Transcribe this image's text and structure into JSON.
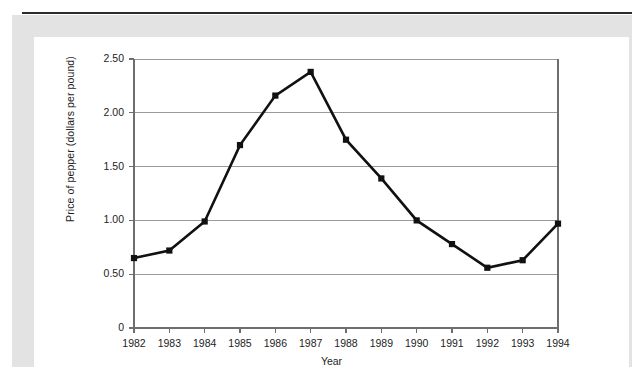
{
  "figure": {
    "background": "#ffffff",
    "mat_color": "#e3e3e3",
    "rule_color": "#2b2b2b"
  },
  "chart_data": {
    "type": "line",
    "title": "",
    "xlabel": "Year",
    "ylabel": "Price of pepper (dollars per pound)",
    "categories": [
      "1982",
      "1983",
      "1984",
      "1985",
      "1986",
      "1987",
      "1988",
      "1989",
      "1990",
      "1991",
      "1992",
      "1993",
      "1994"
    ],
    "x": [
      1982,
      1983,
      1984,
      1985,
      1986,
      1987,
      1988,
      1989,
      1990,
      1991,
      1992,
      1993,
      1994
    ],
    "values": [
      0.65,
      0.72,
      0.99,
      1.7,
      2.16,
      2.38,
      1.75,
      1.39,
      1.0,
      0.78,
      0.56,
      0.63,
      0.97
    ],
    "series": [
      {
        "name": "Price of pepper",
        "values": [
          0.65,
          0.72,
          0.99,
          1.7,
          2.16,
          2.38,
          1.75,
          1.39,
          1.0,
          0.78,
          0.56,
          0.63,
          0.97
        ],
        "line_color": "#111111",
        "marker": "square",
        "marker_color": "#111111"
      }
    ],
    "ylim": [
      0,
      2.5
    ],
    "xlim": [
      1982,
      1994
    ],
    "yticks": [
      0,
      0.5,
      1.0,
      1.5,
      2.0,
      2.5
    ],
    "ytick_labels": [
      "0",
      "0.50",
      "1.00",
      "1.50",
      "2.00",
      "2.50"
    ],
    "xtick_labels": [
      "1982",
      "1983",
      "1984",
      "1985",
      "1986",
      "1987",
      "1988",
      "1989",
      "1990",
      "1991",
      "1992",
      "1993",
      "1994"
    ],
    "grid": "horizontal",
    "grid_color": "#9a9a9a",
    "axis_color": "#6e6e6e",
    "legend": "none",
    "legend_position": "none",
    "annotations": []
  }
}
